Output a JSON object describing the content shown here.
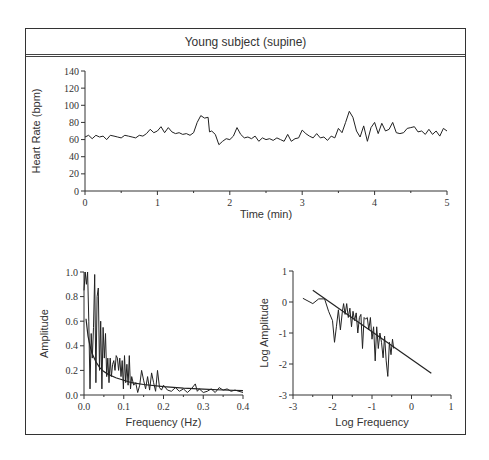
{
  "title": "Young subject (supine)",
  "chart_data": [
    {
      "id": "heart-rate",
      "type": "line",
      "title": "Young subject (supine)",
      "xlabel": "Time (min)",
      "ylabel": "Heart Rate (bpm)",
      "xlim": [
        0,
        5
      ],
      "ylim": [
        0,
        140
      ],
      "xticks": [
        "0",
        "1",
        "2",
        "3",
        "4",
        "5"
      ],
      "yticks": [
        "0",
        "20",
        "40",
        "60",
        "80",
        "100",
        "120",
        "140"
      ],
      "grid": false,
      "series": [
        {
          "name": "Heart rate",
          "x": [
            0,
            0.05,
            0.1,
            0.15,
            0.2,
            0.25,
            0.3,
            0.35,
            0.4,
            0.45,
            0.5,
            0.55,
            0.6,
            0.65,
            0.7,
            0.75,
            0.8,
            0.85,
            0.9,
            0.95,
            1.0,
            1.05,
            1.1,
            1.15,
            1.2,
            1.25,
            1.3,
            1.35,
            1.4,
            1.45,
            1.5,
            1.55,
            1.6,
            1.65,
            1.7,
            1.72,
            1.75,
            1.8,
            1.85,
            1.9,
            1.95,
            2.0,
            2.05,
            2.1,
            2.15,
            2.2,
            2.25,
            2.3,
            2.35,
            2.4,
            2.45,
            2.5,
            2.55,
            2.6,
            2.65,
            2.7,
            2.75,
            2.8,
            2.85,
            2.9,
            2.95,
            3.0,
            3.05,
            3.1,
            3.15,
            3.2,
            3.25,
            3.3,
            3.35,
            3.4,
            3.45,
            3.5,
            3.55,
            3.6,
            3.65,
            3.7,
            3.75,
            3.8,
            3.85,
            3.9,
            3.95,
            4.0,
            4.05,
            4.1,
            4.15,
            4.2,
            4.25,
            4.3,
            4.35,
            4.4,
            4.45,
            4.5,
            4.55,
            4.6,
            4.65,
            4.7,
            4.75,
            4.8,
            4.85,
            4.9,
            4.95,
            5.0
          ],
          "y": [
            63,
            65,
            61,
            65,
            63,
            64,
            60,
            65,
            64,
            63,
            62,
            65,
            64,
            63,
            62,
            65,
            64,
            67,
            72,
            68,
            70,
            75,
            68,
            74,
            69,
            67,
            68,
            66,
            67,
            65,
            68,
            80,
            88,
            85,
            86,
            69,
            70,
            66,
            54,
            58,
            61,
            60,
            64,
            74,
            66,
            62,
            63,
            61,
            64,
            58,
            62,
            60,
            61,
            59,
            62,
            60,
            58,
            66,
            58,
            61,
            62,
            71,
            67,
            64,
            62,
            67,
            62,
            63,
            59,
            64,
            62,
            73,
            68,
            80,
            93,
            86,
            70,
            63,
            76,
            58,
            74,
            80,
            67,
            79,
            70,
            72,
            80,
            68,
            67,
            68,
            73,
            74,
            75,
            69,
            70,
            66,
            72,
            66,
            70,
            64,
            73,
            70
          ]
        }
      ]
    },
    {
      "id": "amplitude-spectrum",
      "type": "line",
      "xlabel": "Frequency (Hz)",
      "ylabel": "Amplitude",
      "xlim": [
        0,
        0.4
      ],
      "ylim": [
        0,
        1.0
      ],
      "xticks": [
        "0.0",
        "0.1",
        "0.2",
        "0.3",
        "0.4"
      ],
      "yticks": [
        "0.0",
        "0.2",
        "0.4",
        "0.6",
        "0.8",
        "1.0"
      ],
      "grid": false,
      "series": [
        {
          "name": "Spectrum",
          "x": [
            0.0,
            0.003,
            0.006,
            0.009,
            0.012,
            0.015,
            0.018,
            0.021,
            0.024,
            0.027,
            0.03,
            0.033,
            0.036,
            0.039,
            0.042,
            0.045,
            0.048,
            0.051,
            0.054,
            0.057,
            0.06,
            0.063,
            0.066,
            0.069,
            0.072,
            0.075,
            0.078,
            0.081,
            0.084,
            0.087,
            0.09,
            0.093,
            0.096,
            0.099,
            0.102,
            0.105,
            0.108,
            0.111,
            0.114,
            0.117,
            0.12,
            0.125,
            0.13,
            0.135,
            0.14,
            0.145,
            0.15,
            0.155,
            0.16,
            0.165,
            0.17,
            0.175,
            0.18,
            0.185,
            0.19,
            0.195,
            0.2,
            0.21,
            0.22,
            0.23,
            0.24,
            0.25,
            0.26,
            0.27,
            0.28,
            0.285,
            0.29,
            0.3,
            0.31,
            0.32,
            0.33,
            0.34,
            0.35,
            0.36,
            0.37,
            0.38,
            0.39,
            0.4
          ],
          "y": [
            0.85,
            1.0,
            0.9,
            1.0,
            0.6,
            0.05,
            0.5,
            0.3,
            0.55,
            0.98,
            0.1,
            0.8,
            0.87,
            0.2,
            0.6,
            0.05,
            0.55,
            0.3,
            0.5,
            0.15,
            0.3,
            0.1,
            0.3,
            0.15,
            0.25,
            0.28,
            0.2,
            0.32,
            0.3,
            0.2,
            0.3,
            0.15,
            0.28,
            0.05,
            0.32,
            0.1,
            0.25,
            0.08,
            0.32,
            0.05,
            0.15,
            0.08,
            0.1,
            0.02,
            0.08,
            0.2,
            0.12,
            0.05,
            0.15,
            0.04,
            0.18,
            0.1,
            0.03,
            0.2,
            0.06,
            0.04,
            0.08,
            0.04,
            0.03,
            0.06,
            0.03,
            0.05,
            0.02,
            0.05,
            0.09,
            0.03,
            0.05,
            0.02,
            0.03,
            0.05,
            0.02,
            0.06,
            0.04,
            0.05,
            0.03,
            0.04,
            0.03,
            0.02
          ]
        },
        {
          "name": "Power-law fit",
          "x": [
            0.005,
            0.01,
            0.015,
            0.02,
            0.03,
            0.04,
            0.05,
            0.06,
            0.08,
            0.1,
            0.12,
            0.15,
            0.2,
            0.25,
            0.3,
            0.35,
            0.4
          ],
          "y": [
            0.62,
            0.48,
            0.4,
            0.34,
            0.27,
            0.22,
            0.19,
            0.17,
            0.14,
            0.12,
            0.1,
            0.085,
            0.068,
            0.055,
            0.047,
            0.041,
            0.036
          ]
        }
      ]
    },
    {
      "id": "log-log-spectrum",
      "type": "line",
      "xlabel": "Log Frequency",
      "ylabel": "Log Amplitude",
      "xlim": [
        -3,
        1
      ],
      "ylim": [
        -3,
        1
      ],
      "xticks": [
        "-3",
        "-2",
        "-1",
        "0",
        "1"
      ],
      "yticks": [
        "-3",
        "-2",
        "-1",
        "0",
        "1"
      ],
      "grid": false,
      "series": [
        {
          "name": "Log spectrum",
          "x": [
            -2.75,
            -2.5,
            -2.35,
            -2.2,
            -2.1,
            -2.0,
            -1.95,
            -1.9,
            -1.85,
            -1.8,
            -1.75,
            -1.72,
            -1.68,
            -1.64,
            -1.6,
            -1.56,
            -1.52,
            -1.48,
            -1.44,
            -1.4,
            -1.36,
            -1.32,
            -1.28,
            -1.24,
            -1.2,
            -1.16,
            -1.12,
            -1.08,
            -1.04,
            -1.0,
            -0.96,
            -0.92,
            -0.88,
            -0.84,
            -0.8,
            -0.76,
            -0.72,
            -0.68,
            -0.64,
            -0.6,
            -0.56,
            -0.52,
            -0.48,
            -0.45
          ],
          "y": [
            0.12,
            -0.05,
            0.1,
            0.1,
            -0.3,
            -0.6,
            -1.3,
            -0.8,
            -0.25,
            -0.9,
            -0.3,
            -0.05,
            -0.4,
            -0.05,
            -0.5,
            -0.2,
            -0.8,
            -0.3,
            -0.6,
            -0.35,
            -1.0,
            -0.5,
            -0.4,
            -1.5,
            -0.5,
            -0.55,
            -0.5,
            -0.9,
            -0.5,
            -1.2,
            -0.8,
            -1.9,
            -0.8,
            -1.5,
            -1.0,
            -1.3,
            -1.8,
            -1.1,
            -1.9,
            -2.4,
            -1.3,
            -1.7,
            -1.2,
            -1.5
          ]
        },
        {
          "name": "Linear fit",
          "x": [
            -2.5,
            0.5
          ],
          "y": [
            0.38,
            -2.3
          ]
        }
      ]
    }
  ]
}
